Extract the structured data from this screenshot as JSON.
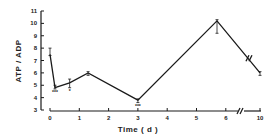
{
  "chart_data": {
    "type": "line",
    "title": "",
    "xlabel": "Time ( d )",
    "ylabel": "ATP / ADP",
    "xlim": [
      0,
      10
    ],
    "ylim": [
      3,
      11
    ],
    "x_ticks": [
      "0",
      "1",
      "2",
      "3",
      "4",
      "5",
      "6",
      "10"
    ],
    "y_ticks": [
      "3",
      "4",
      "5",
      "6",
      "7",
      "8",
      "9",
      "10",
      "11"
    ],
    "axis_break": "between 6 and 10 on x-axis and on the final line segment",
    "grid": false,
    "series": [
      {
        "name": "ATP/ADP",
        "x": [
          0,
          0.17,
          0.67,
          1.3,
          3,
          5.7,
          10
        ],
        "values": [
          7.5,
          4.8,
          5.2,
          6.0,
          3.8,
          10.2,
          6.0
        ],
        "error_up": [
          0.5,
          0.2,
          0.3,
          0.1,
          0.1,
          0.1,
          0.1
        ],
        "error_down": [
          0.1,
          0.1,
          0.4,
          0.2,
          0.2,
          1.0,
          0.2
        ],
        "significance": [
          "",
          "***",
          "*",
          "",
          "***",
          "",
          ""
        ]
      }
    ]
  }
}
